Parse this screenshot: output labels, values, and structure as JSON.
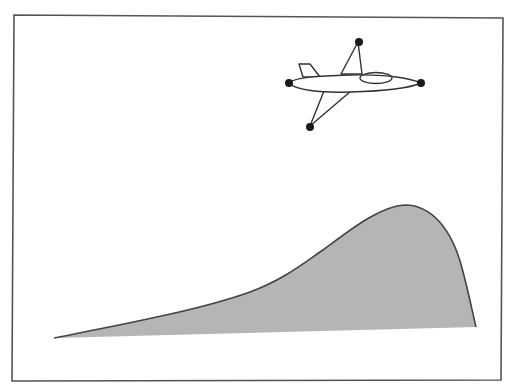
{
  "figure": {
    "description": "Airplane flying above a hill-shaped curve",
    "frame": {
      "stroke": "#555555"
    },
    "airplane": {
      "stroke": "#333333",
      "fill": "#ffffff",
      "wingtip_color": "#1a1a1a"
    },
    "curve": {
      "fill": "#b5b5b5",
      "stroke": "#444444",
      "start": [
        54,
        338
      ],
      "peak": [
        407,
        205
      ],
      "end": [
        476,
        327
      ]
    }
  }
}
